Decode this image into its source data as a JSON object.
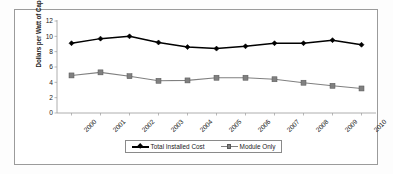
{
  "chart_data": {
    "type": "line",
    "title": "",
    "subtitle": "",
    "xlabel": "",
    "ylabel": "Dollars per Watt of Capacity",
    "categories": [
      "2000",
      "2001",
      "2002",
      "2003",
      "2004",
      "2005",
      "2006",
      "2007",
      "2008",
      "2009",
      "2010"
    ],
    "ylim": [
      0,
      12
    ],
    "yticks": [
      "0",
      "2",
      "4",
      "6",
      "8",
      "10",
      "12"
    ],
    "grid": false,
    "legend_position": "bottom",
    "series": [
      {
        "name": "Total Installed Cost",
        "color": "#000000",
        "marker": "diamond",
        "values": [
          9.1,
          9.7,
          10.0,
          9.2,
          8.6,
          8.4,
          8.7,
          9.1,
          9.1,
          9.5,
          8.9
        ]
      },
      {
        "name": "Module Only",
        "color": "#808080",
        "marker": "square",
        "values": [
          4.9,
          5.3,
          4.8,
          4.2,
          4.25,
          4.6,
          4.6,
          4.4,
          3.95,
          3.55,
          3.2
        ]
      }
    ],
    "annotations": []
  },
  "frame": {
    "border_color": "#9b9b9b",
    "background": "#ffffff"
  }
}
